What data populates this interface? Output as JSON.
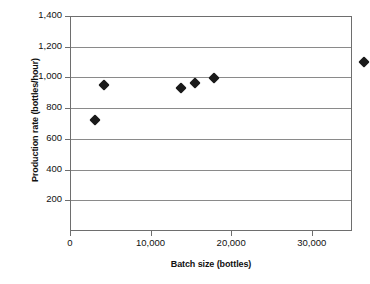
{
  "chart_data": {
    "type": "scatter",
    "title": "",
    "xlabel": "Batch size (bottles)",
    "ylabel": "Production rate (bottles/hour)",
    "xlim": [
      0,
      35000
    ],
    "ylim": [
      0,
      1400
    ],
    "grid": true,
    "legend": null,
    "marker": "filled-diamond",
    "marker_color": "#1a1a1a",
    "xticks": [
      0,
      10000,
      20000,
      30000
    ],
    "xtick_labels": [
      "0",
      "10,000",
      "20,000",
      "30,000"
    ],
    "yticks": [
      200,
      400,
      600,
      800,
      1000,
      1200,
      1400
    ],
    "ytick_labels": [
      "200",
      "400",
      "600",
      "800",
      "1,000",
      "1,200",
      "1,400"
    ],
    "points": [
      {
        "x": 3000,
        "y": 730
      },
      {
        "x": 4100,
        "y": 955
      },
      {
        "x": 13600,
        "y": 940
      },
      {
        "x": 15400,
        "y": 970
      },
      {
        "x": 17700,
        "y": 1000
      },
      {
        "x": 36400,
        "y": 1105
      },
      {
        "x": 40400,
        "y": 1130
      },
      {
        "x": 41400,
        "y": 1210
      },
      {
        "x": 43000,
        "y": 1253
      }
    ]
  },
  "axes": {
    "y_title": "Production rate (bottles/hour)",
    "x_title": "Batch size (bottles)"
  }
}
